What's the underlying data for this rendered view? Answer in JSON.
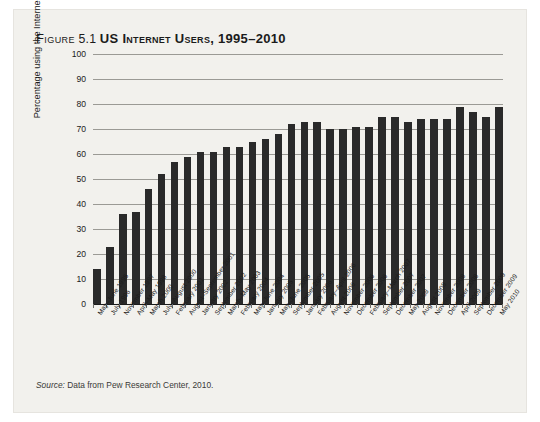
{
  "figure": {
    "label_word": "Figure",
    "number": "5.1",
    "title": "US Internet Users, 1995–2010",
    "full_title": "Figure 5.1 US Internet Users, 1995–2010"
  },
  "source": {
    "label": "Source:",
    "text": " Data from Pew Research Center, 2010."
  },
  "chart_data": {
    "type": "bar",
    "title": "US Internet Users, 1995–2010",
    "xlabel": "",
    "ylabel": "Percentage using the Internet",
    "ylim": [
      0,
      100
    ],
    "yticks": [
      0,
      10,
      20,
      30,
      40,
      50,
      60,
      70,
      80,
      90,
      100
    ],
    "grid": true,
    "legend": false,
    "bar_color": "#2a2a2a",
    "categories": [
      "May–June 1995",
      "July 1996",
      "November 1997",
      "April–May 1998",
      "March 2000",
      "July–August 2000",
      "February 2001",
      "August–September 2001",
      "January 2002",
      "September 2002",
      "March–May 2003",
      "February 2004",
      "May–June 2004",
      "January 2005",
      "May–June 2005",
      "September 2005",
      "January 2006",
      "February–April 2006",
      "August 2006",
      "November 2006",
      "December 2006",
      "February–March 2007",
      "September 2007",
      "December 2007",
      "May 2008",
      "August 2008",
      "November 2008",
      "December 2008",
      "April 2009",
      "September 2009",
      "December 2009",
      "May 2010"
    ],
    "values": [
      14,
      23,
      36,
      37,
      46,
      52,
      57,
      59,
      61,
      61,
      63,
      63,
      65,
      66,
      68,
      72,
      73,
      73,
      70,
      70,
      71,
      71,
      75,
      75,
      73,
      74,
      74,
      74,
      79,
      77,
      75,
      79
    ]
  }
}
